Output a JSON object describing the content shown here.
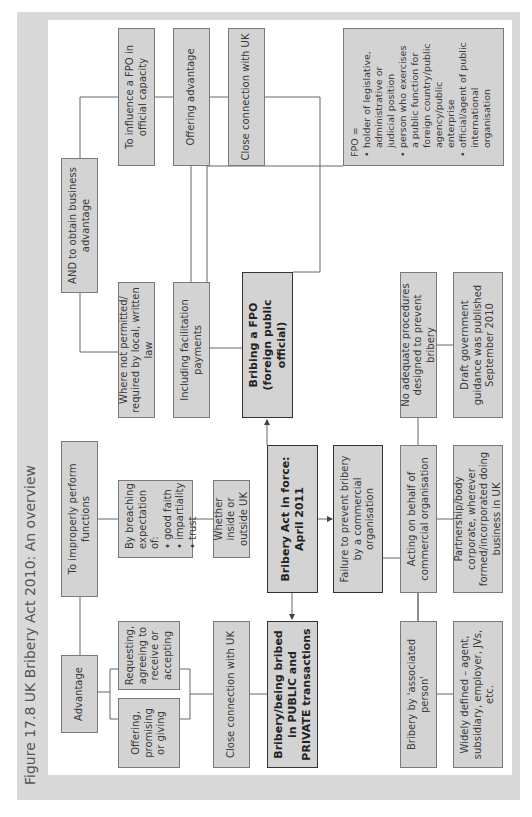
{
  "figure": {
    "title": "Figure 17.8  UK Bribery Act 2010: An overview"
  },
  "central": {
    "act": "Bribery Act in force: April 2011",
    "bribery_public_private": "Bribery/being bribed in PUBLIC and PRIVATE transactions",
    "bribing_fpo": "Bribing a FPO (foreign public official)",
    "failure_to_prevent": "Failure to prevent bribery by a commercial organisation"
  },
  "bribery_branch": {
    "advantage": "Advantage",
    "to_improperly_perform": "To improperly perform functions",
    "offering": "Offering, promising or giving",
    "requesting": "Requesting, agreeing to receive or accepting",
    "breaching_intro": "By breaching expectation of:",
    "breaching_items": [
      "good faith",
      "impartiality",
      "trust"
    ],
    "inside_outside": "Whether inside or outside UK",
    "close_connection": "Close connection with UK"
  },
  "fpo_branch": {
    "and_business": "AND to obtain business advantage",
    "influence": "To influence a FPO in official capacity",
    "offering_advantage": "Offering advantage",
    "not_permitted": "Where not permitted/ required by local, written law",
    "facilitation": "Including facilitation payments",
    "close_connection": "Close connection with UK",
    "definition_title": "FPO =",
    "definition_items": [
      "holder of legislative, administrative or judicial position",
      "person who exercises a public function for foreign country/public agency/public enterprise",
      "official/agent of public international organisation"
    ]
  },
  "failure_branch": {
    "associated_person": "Bribery by 'associated person'",
    "acting_on_behalf": "Acting on behalf of commercial organisation",
    "no_adequate": "No adequate procedures designed to prevent bribery",
    "widely_defined": "Widely defined – agent, subsidiary, employer, JVs, etc.",
    "partnership": "Partnership/body corporate, wherever formed/incorporated doing business in UK",
    "draft_guidance": "Draft government guidance was published September 2010"
  },
  "colors": {
    "box_fill": "#d3d3d3",
    "frame": "#d9d9d9",
    "border": "#7a7a7a",
    "bold_border": "#333333"
  }
}
